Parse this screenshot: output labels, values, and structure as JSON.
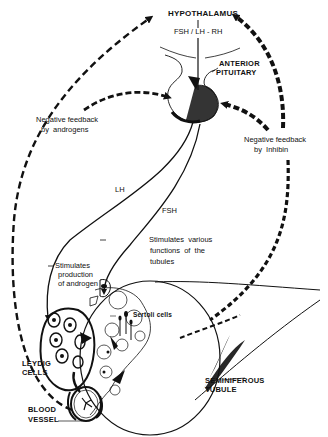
{
  "diagram": {
    "colors": {
      "ink": "#111111",
      "background": "#ffffff"
    },
    "labels": {
      "hypothalamus": "HYPOTHALAMUS",
      "fsh_lh_rh": "FSH / LH - RH",
      "anterior_pituitary_1": "ANTERIOR",
      "anterior_pituitary_2": "PITUITARY",
      "neg_feedback_androgens_1": "Negative feedback",
      "neg_feedback_androgens_2": "by  androgens",
      "neg_feedback_inhibin_1": "Negative feedback",
      "neg_feedback_inhibin_2": "by  Inhibin",
      "lh": "LH",
      "fsh": "FSH",
      "stim_androgen_1": "Stimulates",
      "stim_androgen_2": "production",
      "stim_androgen_3": "of androgen",
      "stim_tubules_1": "Stimulates  various",
      "stim_tubules_2": "functions  of  the",
      "stim_tubules_3": "tubules",
      "sertoli": "Sertoli cells",
      "leydig_1": "LEYDIG",
      "leydig_2": "CELLS",
      "seminiferous_1": "SEMINIFEROUS",
      "seminiferous_2": "TUBULE",
      "blood_vessel_1": "BLOOD",
      "blood_vessel_2": "VESSEL"
    }
  }
}
